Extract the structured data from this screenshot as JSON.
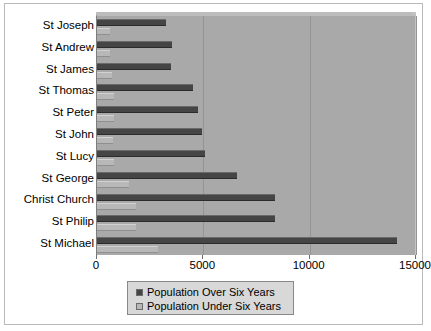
{
  "chart_data": {
    "type": "bar",
    "orientation": "horizontal",
    "title": "",
    "xlabel": "",
    "ylabel": "",
    "xlim": [
      0,
      15000
    ],
    "xticks": [
      0,
      5000,
      10000,
      15000
    ],
    "xtick_labels": [
      "0",
      "5000",
      "10000",
      "15000"
    ],
    "grid": true,
    "legend_position": "bottom",
    "categories": [
      "St Joseph",
      "St Andrew",
      "St James",
      "St Thomas",
      "St Peter",
      "St John",
      "St Lucy",
      "St George",
      "Christ Church",
      "St Philip",
      "St Michael"
    ],
    "series": [
      {
        "name": "Population Over Six Years",
        "color": "#454545",
        "values": [
          3250,
          3550,
          3500,
          4500,
          4750,
          4950,
          5100,
          6600,
          8350,
          8350,
          14100
        ]
      },
      {
        "name": "Population Under Six Years",
        "color": "#b8b8b8",
        "values": [
          600,
          620,
          700,
          780,
          800,
          760,
          800,
          1500,
          1820,
          1820,
          2850
        ]
      }
    ]
  },
  "legend": {
    "entries": [
      {
        "label": "Population Over Six Years"
      },
      {
        "label": "Population Under Six Years"
      }
    ]
  },
  "colors": {
    "plot_background": "#a9a9a9",
    "frame_border": "#b9b9b9",
    "gridline": "#949494",
    "legend_background": "#d8d8d8",
    "legend_border": "#888888"
  }
}
